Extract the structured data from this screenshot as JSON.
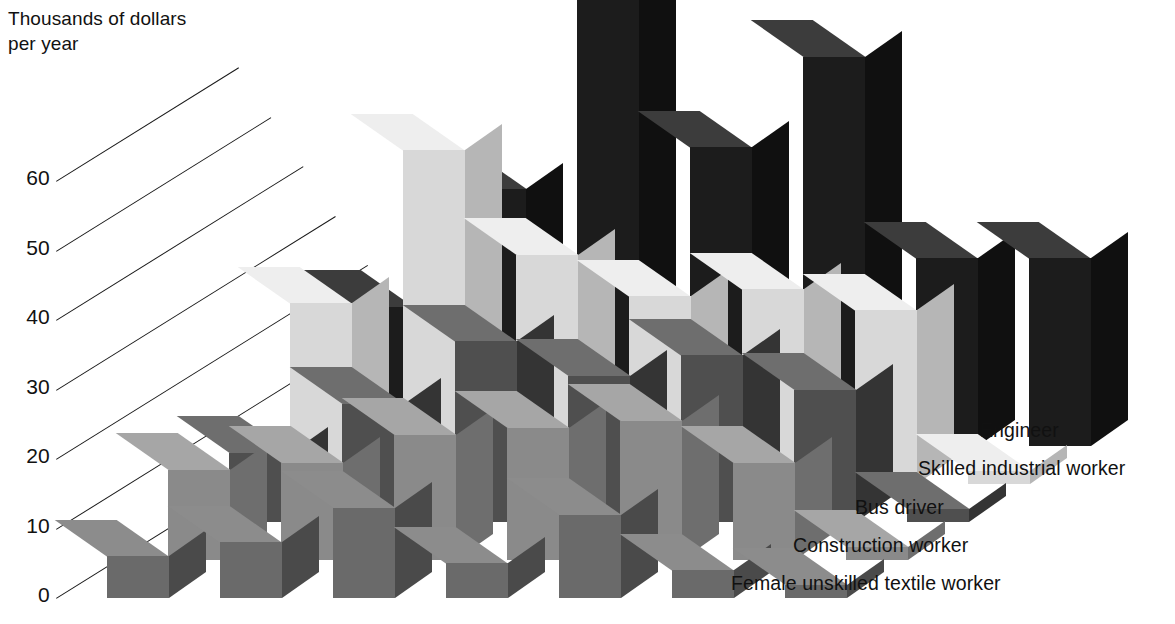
{
  "axis": {
    "title": "Thousands of dollars\nper year",
    "ticks": [
      "60",
      "50",
      "40",
      "30",
      "20",
      "10",
      "0"
    ],
    "tick_values": [
      60,
      50,
      40,
      30,
      20,
      10,
      0
    ]
  },
  "legend": {
    "items": [
      {
        "label": "Engineer",
        "color": "#1c1c1c"
      },
      {
        "label": "Skilled industrial worker",
        "color": "#d8d8d8"
      },
      {
        "label": "Bus driver",
        "color": "#4f4f4f"
      },
      {
        "label": "Construction worker",
        "color": "#8a8a8a"
      },
      {
        "label": "Female unskilled textile worker",
        "color": "#6a6a6a"
      }
    ]
  },
  "colors": {
    "engineer_front": "#1c1c1c",
    "engineer_top": "#3c3c3c",
    "engineer_side": "#101010",
    "skilled_front": "#d8d8d8",
    "skilled_top": "#eeeeee",
    "skilled_side": "#b6b6b6",
    "bus_front": "#4f4f4f",
    "bus_top": "#6e6e6e",
    "bus_side": "#343434",
    "construction_front": "#8a8a8a",
    "construction_top": "#a6a6a6",
    "construction_side": "#6e6e6e",
    "textile_front": "#6a6a6a",
    "textile_top": "#8c8c8c",
    "textile_side": "#4a4a4a",
    "gridline": "#1a1a1a",
    "background": "#ffffff",
    "text": "#111111"
  },
  "chart_data": {
    "type": "bar",
    "title": "Thousands of dollars per year",
    "xlabel": "",
    "ylabel": "Thousands of dollars per year",
    "ylim": [
      0,
      70
    ],
    "grid": true,
    "legend_position": "right",
    "projection": "3d",
    "categories": [
      "1",
      "2",
      "3",
      "4",
      "5",
      "6"
    ],
    "series": [
      {
        "name": "Engineer",
        "values": [
          20,
          37,
          66,
          43,
          56,
          27
        ]
      },
      {
        "name": "Skilled industrial worker",
        "values": [
          26,
          48,
          33,
          27,
          28,
          25
        ]
      },
      {
        "name": "Bus driver",
        "values": [
          10,
          17,
          26,
          21,
          24,
          19
        ]
      },
      {
        "name": "Construction worker",
        "values": [
          13,
          14,
          18,
          19,
          20,
          14
        ]
      },
      {
        "name": "Female unskilled textile worker",
        "values": [
          6,
          8,
          13,
          5,
          12,
          4
        ]
      }
    ]
  }
}
